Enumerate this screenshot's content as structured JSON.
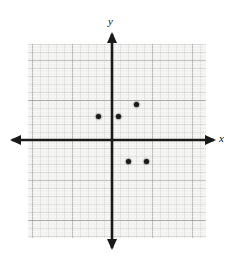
{
  "figure": {
    "type": "cartesian-coordinate-plane",
    "title": "",
    "axis_labels": {
      "x": "x",
      "y": "y"
    },
    "origin_px": {
      "x": 112,
      "y": 140
    },
    "grid": {
      "minor_cell_px": 8,
      "major_cell_px": 40,
      "panel_px": {
        "left": 28,
        "top": 44,
        "width": 178,
        "height": 194
      },
      "background_color": "#f2f2f0",
      "minor_line_color": "#787878",
      "major_line_color": "#5a5a5a",
      "visible": true
    },
    "axes": {
      "color": "#1a1a1a",
      "arrowheads": [
        "left",
        "right",
        "up",
        "down"
      ],
      "x_axis_y_px": 140,
      "y_axis_x_px": 112
    }
  },
  "chart_data": {
    "type": "scatter",
    "title": "",
    "xlabel": "x",
    "ylabel": "y",
    "grid": true,
    "legend": null,
    "xlim": [
      -10.5,
      11.75
    ],
    "ylim": [
      -12.25,
      12
    ],
    "unit_px": 8,
    "tick_interval": 1,
    "major_tick_interval": 5,
    "tick_labels_shown": false,
    "points": [
      {
        "x": -1.75,
        "y": 3.0,
        "px": 98,
        "py": 116
      },
      {
        "x": 0.75,
        "y": 3.0,
        "px": 118,
        "py": 116
      },
      {
        "x": 3.0,
        "y": 4.5,
        "px": 136,
        "py": 104
      },
      {
        "x": 2.0,
        "y": -2.6,
        "px": 128,
        "py": 161
      },
      {
        "x": 4.25,
        "y": -2.6,
        "px": 146,
        "py": 161
      }
    ],
    "point_color": "#1a1a1a",
    "point_radius_px": 2.5,
    "series": [
      {
        "name": "plotted points",
        "x": [
          -1.75,
          0.75,
          3.0,
          2.0,
          4.25
        ],
        "values": [
          3.0,
          3.0,
          4.5,
          -2.6,
          -2.6
        ]
      }
    ]
  }
}
